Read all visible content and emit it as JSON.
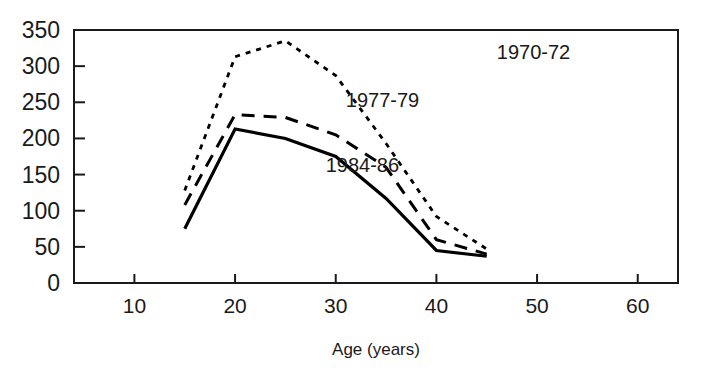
{
  "chart_data": {
    "type": "line",
    "title": "",
    "subtitle": "",
    "xlabel": "Age (years)",
    "ylabel": "",
    "xlim": [
      4,
      64
    ],
    "ylim": [
      0,
      350
    ],
    "grid": false,
    "legend_position": "inline-annotations",
    "x_ticks": [
      10,
      20,
      30,
      40,
      50,
      60
    ],
    "x_tick_labels": [
      "10",
      "20",
      "30",
      "40",
      "50",
      "60"
    ],
    "y_ticks": [
      0,
      50,
      100,
      150,
      200,
      250,
      300,
      350
    ],
    "y_tick_labels": [
      "0",
      "50",
      "100",
      "150",
      "200",
      "250",
      "300",
      "350"
    ],
    "x": [
      15,
      20,
      25,
      30,
      35,
      40,
      45
    ],
    "series": [
      {
        "name": "1970-72",
        "style": "dotted",
        "values": [
          128,
          313,
          335,
          287,
          193,
          92,
          47
        ]
      },
      {
        "name": "1977-79",
        "style": "dashed",
        "values": [
          108,
          233,
          229,
          205,
          160,
          60,
          40
        ]
      },
      {
        "name": "1984-86",
        "style": "solid",
        "values": [
          75,
          213,
          200,
          175,
          117,
          45,
          37
        ]
      }
    ],
    "annotations": [
      {
        "text": "1970-72",
        "x": 46,
        "y": 320
      },
      {
        "text": "1977-79",
        "x": 31,
        "y": 253
      },
      {
        "text": "1984-86",
        "x": 29,
        "y": 163
      }
    ],
    "colors": {
      "line": "#000000",
      "axis": "#1a1a1a",
      "background": "#ffffff"
    }
  }
}
